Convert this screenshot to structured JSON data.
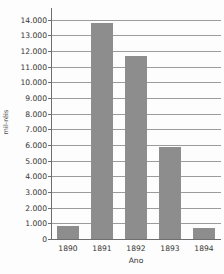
{
  "chart_data": {
    "type": "bar",
    "title": "",
    "xlabel": "Ano",
    "ylabel": "mil-réis",
    "categories": [
      "1890",
      "1891",
      "1892",
      "1893",
      "1894"
    ],
    "values": [
      820,
      13800,
      11650,
      5850,
      700
    ],
    "ylim": [
      0,
      14800
    ],
    "ytick_values": [
      0,
      1000,
      2000,
      3000,
      4000,
      5000,
      6000,
      7000,
      8000,
      9000,
      10000,
      11000,
      12000,
      13000,
      14000
    ],
    "ytick_labels": [
      "0",
      "1.000",
      "2.000",
      "3.000",
      "4.000",
      "5.000",
      "6.000",
      "7.000",
      "8.000",
      "9.000",
      "10.000",
      "11.000",
      "12.000",
      "13.000",
      "14.000"
    ],
    "grid": true,
    "legend": null,
    "bar_color": "#8d8d8d",
    "grid_color": "#9b9b9b",
    "axis_color": "#6e6e6e",
    "background_color": "#fdfdfd"
  }
}
